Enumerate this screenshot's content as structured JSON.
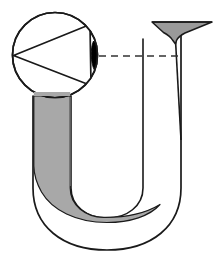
{
  "figure": {
    "title": "U-tube with funnel and magnified inset",
    "width": 219,
    "height": 259,
    "background_color": "#ffffff"
  },
  "colors": {
    "outline": "#1a1a1a",
    "liquid_fill": "#a8a8a8",
    "funnel_fill": "#9a9a9a",
    "marker_fill": "#000000",
    "dashed_line": "#333333",
    "background": "#ffffff"
  },
  "elements": {
    "u_tube": {
      "name": "u-tube",
      "label": "U-tube",
      "stroke_width": 1.6
    },
    "left_arm": {
      "name": "left-arm",
      "label": "Left arm",
      "filled": true
    },
    "right_arm": {
      "name": "right-arm",
      "label": "Right arm",
      "filled": false
    },
    "bottom_bend": {
      "name": "bottom-bend",
      "label": "Bottom bend"
    },
    "liquid": {
      "name": "liquid-column",
      "label": "Liquid column",
      "fill": "#a8a8a8"
    },
    "funnel": {
      "name": "funnel-mouth",
      "label": "Funnel mouth",
      "fill": "#9a9a9a"
    },
    "inset_circle": {
      "name": "magnified-inset-circle",
      "label": "Magnified inset",
      "center_x": 55,
      "center_y": 55,
      "radius": 43
    },
    "inset_wedge": {
      "name": "inset-wedge",
      "label": "Wedge cross-section"
    },
    "lens_marker": {
      "name": "lens-marker",
      "label": "Meniscus marker",
      "fill": "#000000"
    },
    "dashed_level_line": {
      "name": "dashed-level-line",
      "label": "Level reference line",
      "dash_pattern": "7 5"
    }
  },
  "labels": {
    "none_visible": ""
  }
}
